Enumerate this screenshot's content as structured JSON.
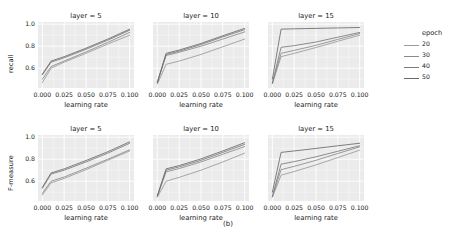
{
  "caption": "(b)",
  "legend": {
    "title": "epoch",
    "items": [
      {
        "label": "20",
        "color": "#9a9a9a"
      },
      {
        "label": "30",
        "color": "#8a8a8a"
      },
      {
        "label": "40",
        "color": "#7a7a7a"
      },
      {
        "label": "50",
        "color": "#6a6a6a"
      }
    ]
  },
  "axes": {
    "xlabel": "learning rate",
    "xticks": [
      "0.000",
      "0.025",
      "0.050",
      "0.075",
      "0.100"
    ],
    "xtick_values": [
      0.0,
      0.025,
      0.05,
      0.075,
      0.1
    ],
    "yticks": [
      "1.0",
      "0.8",
      "0.6"
    ],
    "ytick_values": [
      1.0,
      0.8,
      0.6
    ]
  },
  "chart_data": {
    "type": "line",
    "title": "(b)",
    "xlabel": "learning rate",
    "xlim": [
      -0.005,
      0.105
    ],
    "ylim": [
      0.42,
      1.02
    ],
    "grid": true,
    "legend_position": "right",
    "legend_title": "epoch",
    "facet_col": "layer",
    "facet_col_levels": [
      5,
      10,
      15
    ],
    "facet_row": "metric",
    "facet_row_levels": [
      "recall",
      "F-measure"
    ],
    "x": [
      0.0,
      0.01,
      0.025,
      0.05,
      0.075,
      0.1
    ],
    "panels": [
      {
        "row": "recall",
        "ylabel": "recall",
        "facet_title": "layer = 5",
        "series": [
          {
            "name": "20",
            "color": "#9a9a9a",
            "values": [
              0.47,
              0.6,
              0.655,
              0.735,
              0.82,
              0.9
            ]
          },
          {
            "name": "30",
            "color": "#8a8a8a",
            "values": [
              0.5,
              0.615,
              0.665,
              0.748,
              0.835,
              0.925
            ]
          },
          {
            "name": "40",
            "color": "#7a7a7a",
            "values": [
              0.54,
              0.655,
              0.695,
              0.772,
              0.855,
              0.945
            ]
          },
          {
            "name": "50",
            "color": "#6a6a6a",
            "values": [
              0.545,
              0.665,
              0.705,
              0.782,
              0.865,
              0.955
            ]
          }
        ]
      },
      {
        "row": "recall",
        "ylabel": "recall",
        "facet_title": "layer = 10",
        "series": [
          {
            "name": "20",
            "color": "#9a9a9a",
            "values": [
              0.455,
              0.635,
              0.665,
              0.725,
              0.795,
              0.865
            ]
          },
          {
            "name": "30",
            "color": "#8a8a8a",
            "values": [
              0.47,
              0.715,
              0.745,
              0.8,
              0.865,
              0.93
            ]
          },
          {
            "name": "40",
            "color": "#7a7a7a",
            "values": [
              0.47,
              0.725,
              0.755,
              0.815,
              0.885,
              0.95
            ]
          },
          {
            "name": "50",
            "color": "#6a6a6a",
            "values": [
              0.47,
              0.735,
              0.765,
              0.825,
              0.895,
              0.962
            ]
          }
        ]
      },
      {
        "row": "recall",
        "ylabel": "recall",
        "facet_title": "layer = 15",
        "series": [
          {
            "name": "20",
            "color": "#9a9a9a",
            "values": [
              0.46,
              0.705,
              0.735,
              0.788,
              0.845,
              0.9
            ]
          },
          {
            "name": "30",
            "color": "#8a8a8a",
            "values": [
              0.46,
              0.735,
              0.762,
              0.808,
              0.862,
              0.915
            ]
          },
          {
            "name": "40",
            "color": "#7a7a7a",
            "values": [
              0.465,
              0.79,
              0.805,
              0.838,
              0.882,
              0.925
            ]
          },
          {
            "name": "50",
            "color": "#6a6a6a",
            "values": [
              0.5,
              0.955,
              0.958,
              0.962,
              0.966,
              0.97
            ]
          }
        ]
      },
      {
        "row": "F-measure",
        "ylabel": "F-measure",
        "facet_title": "layer = 5",
        "series": [
          {
            "name": "20",
            "color": "#9a9a9a",
            "values": [
              0.475,
              0.585,
              0.625,
              0.705,
              0.79,
              0.875
            ]
          },
          {
            "name": "30",
            "color": "#8a8a8a",
            "values": [
              0.49,
              0.6,
              0.638,
              0.718,
              0.8,
              0.885
            ]
          },
          {
            "name": "40",
            "color": "#7a7a7a",
            "values": [
              0.535,
              0.665,
              0.7,
              0.775,
              0.855,
              0.945
            ]
          },
          {
            "name": "50",
            "color": "#6a6a6a",
            "values": [
              0.545,
              0.675,
              0.712,
              0.788,
              0.868,
              0.958
            ]
          }
        ]
      },
      {
        "row": "F-measure",
        "ylabel": "F-measure",
        "facet_title": "layer = 10",
        "series": [
          {
            "name": "20",
            "color": "#9a9a9a",
            "values": [
              0.455,
              0.6,
              0.635,
              0.7,
              0.775,
              0.855
            ]
          },
          {
            "name": "30",
            "color": "#8a8a8a",
            "values": [
              0.465,
              0.685,
              0.715,
              0.775,
              0.845,
              0.915
            ]
          },
          {
            "name": "40",
            "color": "#7a7a7a",
            "values": [
              0.465,
              0.7,
              0.73,
              0.79,
              0.862,
              0.935
            ]
          },
          {
            "name": "50",
            "color": "#6a6a6a",
            "values": [
              0.468,
              0.712,
              0.742,
              0.803,
              0.875,
              0.95
            ]
          }
        ]
      },
      {
        "row": "F-measure",
        "ylabel": "F-measure",
        "facet_title": "layer = 15",
        "series": [
          {
            "name": "20",
            "color": "#9a9a9a",
            "values": [
              0.455,
              0.655,
              0.688,
              0.748,
              0.815,
              0.882
            ]
          },
          {
            "name": "30",
            "color": "#8a8a8a",
            "values": [
              0.458,
              0.705,
              0.735,
              0.79,
              0.852,
              0.912
            ]
          },
          {
            "name": "40",
            "color": "#7a7a7a",
            "values": [
              0.462,
              0.755,
              0.778,
              0.822,
              0.872,
              0.922
            ]
          },
          {
            "name": "50",
            "color": "#6a6a6a",
            "values": [
              0.5,
              0.862,
              0.875,
              0.898,
              0.922,
              0.945
            ]
          }
        ]
      }
    ]
  }
}
